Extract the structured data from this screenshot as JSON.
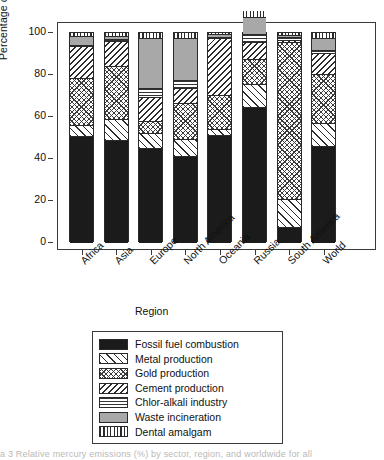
{
  "chart_data": {
    "type": "bar",
    "subtype": "stacked-percentage",
    "title": "",
    "xlabel": "Region",
    "ylabel": "Percentage of total emissions",
    "ylim": [
      0,
      100
    ],
    "yticks": [
      0,
      20,
      40,
      60,
      80,
      100
    ],
    "grid": false,
    "legend_position": "below-plot",
    "categories": [
      "Africa",
      "Asia",
      "Europe",
      "North America",
      "Oceania",
      "Russia",
      "South America",
      "World"
    ],
    "series": [
      {
        "name": "Fossil fuel combustion",
        "pattern": "solid-black",
        "color": "#1b1b1b",
        "values": [
          50.5,
          48.5,
          44.5,
          41.0,
          51.0,
          64.0,
          7.0,
          45.5
        ]
      },
      {
        "name": "Metal production",
        "pattern": "diagonal-forward",
        "color": "#ffffff",
        "values": [
          5.0,
          10.0,
          7.5,
          8.0,
          2.5,
          11.0,
          13.5,
          11.0
        ]
      },
      {
        "name": "Gold production",
        "pattern": "fine-crosshatch",
        "color": "#ffffff",
        "values": [
          22.5,
          25.0,
          5.5,
          17.0,
          16.5,
          12.0,
          74.5,
          23.5
        ]
      },
      {
        "name": "Cement production",
        "pattern": "diagonal-back",
        "color": "#ffffff",
        "values": [
          15.0,
          12.0,
          11.5,
          7.0,
          27.0,
          8.0,
          1.0,
          10.0
        ]
      },
      {
        "name": "Chlor-alkali industry",
        "pattern": "horizontal-lines",
        "color": "#ffffff",
        "values": [
          0.5,
          1.0,
          4.0,
          4.0,
          0.5,
          4.0,
          1.5,
          1.0
        ]
      },
      {
        "name": "Waste incineration",
        "pattern": "solid-gray",
        "color": "#a8a8a8",
        "values": [
          4.5,
          1.5,
          24.0,
          20.0,
          1.5,
          8.0,
          1.0,
          6.0
        ]
      },
      {
        "name": "Dental amalgam",
        "pattern": "vertical-lines",
        "color": "#ffffff",
        "values": [
          2.0,
          2.0,
          3.0,
          3.0,
          1.0,
          3.0,
          1.5,
          3.0
        ]
      }
    ]
  },
  "axes": {
    "y_title": "Percentage of total emissions",
    "x_title": "Region",
    "y_tick_labels": [
      "100",
      "80",
      "60",
      "40",
      "20",
      "0"
    ],
    "x_tick_labels": [
      "Africa",
      "Asia",
      "Europe",
      "North America",
      "Oceania",
      "Russia",
      "South America",
      "World"
    ]
  },
  "legend": {
    "items": [
      {
        "label": "Fossil fuel combustion",
        "swatch": "solid-black-swatch"
      },
      {
        "label": "Metal production",
        "swatch": "diagonal-forward-swatch"
      },
      {
        "label": "Gold production",
        "swatch": "fine-crosshatch-swatch"
      },
      {
        "label": "Cement production",
        "swatch": "diagonal-back-swatch"
      },
      {
        "label": "Chlor-alkali industry",
        "swatch": "horizontal-lines-swatch"
      },
      {
        "label": "Waste incineration",
        "swatch": "solid-gray-swatch"
      },
      {
        "label": "Dental amalgam",
        "swatch": "vertical-lines-swatch"
      }
    ]
  },
  "caption": {
    "text": "a 3 Relative mercury emissions (%) by sector, region, and worldwide for all"
  }
}
